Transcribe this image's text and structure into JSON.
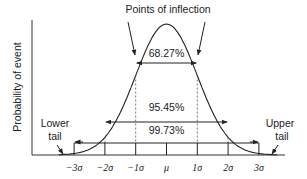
{
  "diagram": {
    "title": "Points of inflection",
    "ylabel": "Probability of event",
    "tails": {
      "lower": [
        "Lower",
        "tail"
      ],
      "upper": [
        "Upper",
        "tail"
      ]
    },
    "intervals": [
      {
        "label": "68.27%",
        "from": -1,
        "to": 1
      },
      {
        "label": "95.45%",
        "from": -2,
        "to": 2
      },
      {
        "label": "99.73%",
        "from": -3,
        "to": 3
      }
    ],
    "ticks": [
      {
        "label": "−3σ",
        "sigma": -3
      },
      {
        "label": "−2σ",
        "sigma": -2
      },
      {
        "label": "−1σ",
        "sigma": -1
      },
      {
        "label": "μ",
        "sigma": 0
      },
      {
        "label": "1σ",
        "sigma": 1
      },
      {
        "label": "2σ",
        "sigma": 2
      },
      {
        "label": "3σ",
        "sigma": 3
      }
    ],
    "colors": {
      "line": "#222222",
      "axis": "#333333",
      "dashed": "#555555"
    }
  },
  "chart_data": {
    "type": "line",
    "title": "Points of inflection",
    "xlabel": "",
    "ylabel": "Probability of event",
    "x_tick_labels": [
      "−3σ",
      "−2σ",
      "−1σ",
      "μ",
      "1σ",
      "2σ",
      "3σ"
    ],
    "series": [
      {
        "name": "Normal distribution",
        "shape": "bell curve"
      }
    ],
    "annotations": [
      "Points of inflection",
      "68.27%",
      "95.45%",
      "99.73%",
      "Lower tail",
      "Upper tail"
    ],
    "grid": false
  }
}
